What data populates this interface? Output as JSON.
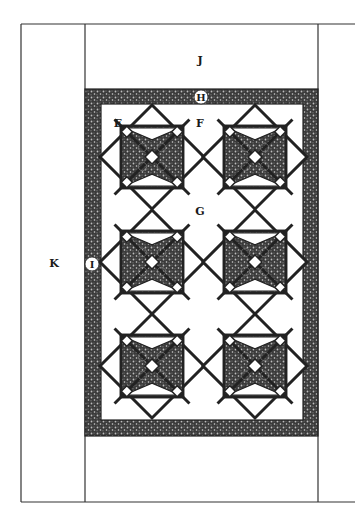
{
  "diagram": {
    "type": "quilt-layout",
    "colors": {
      "line": "#222222",
      "print_dark": "#3a3a3a",
      "background": "#ffffff"
    },
    "labels": {
      "E": "E",
      "F": "F",
      "G": "G",
      "H": "H",
      "I": "I",
      "J": "J",
      "K": "K"
    },
    "blocks": {
      "rows": 3,
      "cols": 2,
      "centers": [
        {
          "x": 152,
          "y": 157
        },
        {
          "x": 255,
          "y": 157
        },
        {
          "x": 152,
          "y": 262
        },
        {
          "x": 255,
          "y": 262
        },
        {
          "x": 152,
          "y": 366
        },
        {
          "x": 255,
          "y": 366
        }
      ],
      "half_diagonal": 52
    }
  }
}
